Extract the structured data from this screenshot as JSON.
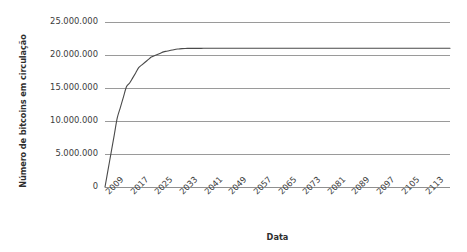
{
  "chart_data": {
    "type": "line",
    "title": "",
    "xlabel": "Data",
    "ylabel": "Número de bitcoins em circulação",
    "xlim": [
      2009,
      2121
    ],
    "ylim": [
      0,
      25000000
    ],
    "grid": true,
    "grid_axis": "y",
    "legend": false,
    "legend_position": "none",
    "y_ticks": [
      25000000,
      20000000,
      15000000,
      10000000,
      5000000,
      0
    ],
    "y_tick_labels": [
      "25.000.000",
      "20.000.000",
      "15.000.000",
      "10.000.000",
      "5.000.000",
      "0"
    ],
    "x_tick_labels": [
      "2009",
      "2017",
      "2025",
      "2033",
      "2041",
      "2049",
      "2057",
      "2065",
      "2073",
      "2081",
      "2089",
      "2097",
      "2105",
      "2113"
    ],
    "x_tick_values": [
      2009,
      2017,
      2025,
      2033,
      2041,
      2049,
      2057,
      2065,
      2073,
      2081,
      2089,
      2097,
      2105,
      2113
    ],
    "x_tick_rotation": -45,
    "series": [
      {
        "name": "Bitcoins em circulação",
        "color": "#4a4a4a",
        "x": [
          2009,
          2010,
          2011,
          2012,
          2013,
          2014,
          2015,
          2016,
          2017,
          2018,
          2019,
          2020,
          2021,
          2022,
          2023,
          2024,
          2025,
          2026,
          2027,
          2028,
          2029,
          2030,
          2031,
          2032,
          2033,
          2034,
          2035,
          2036,
          2037,
          2038,
          2039,
          2040,
          2041,
          2045,
          2049,
          2053,
          2057,
          2061,
          2065,
          2073,
          2081,
          2089,
          2097,
          2105,
          2113,
          2121
        ],
        "y": [
          0,
          2625000,
          5250000,
          7875000,
          10500000,
          12075000,
          13650000,
          15225000,
          15750000,
          16537500,
          17325000,
          18112500,
          18506250,
          18900000,
          19293750,
          19687500,
          19884375,
          20081250,
          20278125,
          20475000,
          20573437,
          20671875,
          20770312,
          20868750,
          20918000,
          20967000,
          20990000,
          21000000,
          21005000,
          21008000,
          21010000,
          21011000,
          21012000,
          21013000,
          21013500,
          21013800,
          21014000,
          21014100,
          21014200,
          21014300,
          21014400,
          21014450,
          21014480,
          21014500,
          21014510,
          21014520
        ]
      }
    ],
    "annotations": []
  },
  "axes": {
    "y_title": "Número de bitcoins em circulação",
    "x_title": "Data"
  },
  "colors": {
    "line": "#4a4a4a",
    "grid": "#9a9a9a",
    "text": "#3c3c3c",
    "background": "#ffffff"
  }
}
